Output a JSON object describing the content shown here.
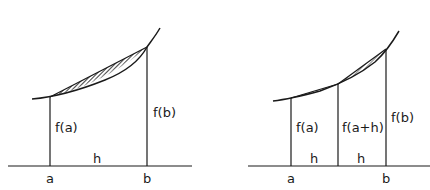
{
  "left_diagram": {
    "labels": {
      "fa": "f(a)",
      "fb": "f(b)",
      "h": "h",
      "a": "a",
      "b": "b"
    },
    "hatched_region": "area between curve and chord from a to b"
  },
  "right_diagram": {
    "labels": {
      "fa": "f(a)",
      "fah": "f(a+h)",
      "fb": "f(b)",
      "h1": "h",
      "h2": "h",
      "a": "a",
      "b": "b"
    },
    "hatched_region": "small areas between curve and chords over two sub-intervals"
  },
  "colors": {
    "ink": "#1a1a1a",
    "background": "#ffffff"
  }
}
